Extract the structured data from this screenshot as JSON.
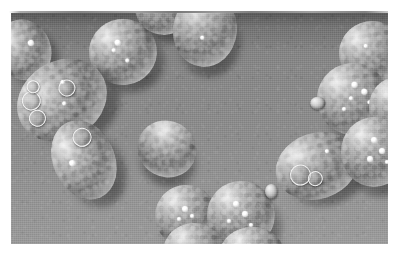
{
  "figure": {
    "kind": "scanning-electron-micrograph",
    "color_mode": "grayscale",
    "border_style": "white margin with thin dark rule along top edge",
    "plate": {
      "left": 11,
      "top": 13,
      "width": 377,
      "height": 231
    },
    "caption": "",
    "scale_bar": "",
    "magnification_label": ""
  },
  "colors": {
    "page_background": "#ffffff",
    "substrate_gray": "#8a8a8a",
    "substrate_top_shade": "#6f6f6f",
    "substrate_bottom_shade": "#9a9a9a",
    "cell_highlight": "#e9e9e9",
    "cell_midtone": "#a6a6a6",
    "cell_shadow": "#4a4a4a",
    "granule_white": "#ffffff",
    "top_rule": "#6f6f6f"
  },
  "micrograph": {
    "cell_count": 16,
    "description": "Ovoid and spherical yeast cells scattered on a smooth gray substrate, lit from the upper left, each casting a soft shadow to the lower right. Several cells show raised circular bud scars and bright surface granules.",
    "cells": [
      {
        "id": "cell-top-left-edge",
        "shape": "ovoid",
        "x": -14,
        "y": 6,
        "w": 54,
        "h": 62,
        "rot": -22,
        "clipped": "left edge",
        "granules": [
          [
            62,
            38,
            3
          ]
        ],
        "scars": [],
        "buds": []
      },
      {
        "id": "cell-top-center-1",
        "shape": "spherical",
        "x": 78,
        "y": 6,
        "w": 68,
        "h": 66,
        "rot": -8,
        "clipped": "",
        "granules": [
          [
            40,
            30,
            3
          ],
          [
            34,
            42,
            2
          ],
          [
            52,
            60,
            2
          ]
        ],
        "scars": [],
        "buds": []
      },
      {
        "id": "cell-top-center-2",
        "shape": "spherical",
        "x": 124,
        "y": -34,
        "w": 58,
        "h": 56,
        "rot": 0,
        "clipped": "top edge",
        "granules": [],
        "scars": [],
        "buds": []
      },
      {
        "id": "cell-top-center-3",
        "shape": "ovoid",
        "x": 162,
        "y": -20,
        "w": 64,
        "h": 74,
        "rot": 6,
        "clipped": "top edge",
        "granules": [
          [
            44,
            58,
            2
          ]
        ],
        "scars": [],
        "buds": []
      },
      {
        "id": "cell-upper-left-scarred",
        "shape": "ovoid",
        "x": 4,
        "y": 48,
        "w": 94,
        "h": 78,
        "rot": -32,
        "clipped": "",
        "granules": [
          [
            58,
            28,
            2
          ],
          [
            48,
            52,
            2
          ]
        ],
        "scars": [
          [
            12,
            18,
            17
          ],
          [
            8,
            42,
            15
          ],
          [
            52,
            30,
            15
          ],
          [
            24,
            8,
            11
          ]
        ],
        "buds": []
      },
      {
        "id": "cell-left-mid",
        "shape": "ovoid",
        "x": 42,
        "y": 106,
        "w": 62,
        "h": 82,
        "rot": -24,
        "clipped": "",
        "granules": [
          [
            26,
            44,
            3
          ]
        ],
        "scars": [
          [
            46,
            12,
            17
          ]
        ],
        "buds": []
      },
      {
        "id": "cell-center-isolated",
        "shape": "ovoid",
        "x": 126,
        "y": 108,
        "w": 60,
        "h": 56,
        "rot": 28,
        "clipped": "",
        "granules": [],
        "scars": [],
        "buds": []
      },
      {
        "id": "cell-bottom-left",
        "shape": "spherical",
        "x": 144,
        "y": 172,
        "w": 62,
        "h": 62,
        "rot": 0,
        "clipped": "",
        "granules": [
          [
            44,
            34,
            3
          ],
          [
            56,
            46,
            2
          ],
          [
            36,
            52,
            2
          ]
        ],
        "scars": [],
        "buds": []
      },
      {
        "id": "cell-bottom-center",
        "shape": "spherical",
        "x": 196,
        "y": 168,
        "w": 68,
        "h": 68,
        "rot": 0,
        "clipped": "",
        "granules": [
          [
            38,
            30,
            3
          ],
          [
            52,
            44,
            3
          ],
          [
            30,
            56,
            2
          ],
          [
            62,
            62,
            2
          ]
        ],
        "scars": [],
        "buds": [
          [
            86,
            4,
            13,
            15
          ]
        ]
      },
      {
        "id": "cell-bottom-lower-1",
        "shape": "spherical",
        "x": 152,
        "y": 210,
        "w": 62,
        "h": 58,
        "rot": 0,
        "clipped": "bottom edge",
        "granules": [],
        "scars": [],
        "buds": []
      },
      {
        "id": "cell-bottom-lower-2",
        "shape": "spherical",
        "x": 208,
        "y": 214,
        "w": 66,
        "h": 58,
        "rot": 0,
        "clipped": "bottom edge",
        "granules": [],
        "scars": [],
        "buds": []
      },
      {
        "id": "cell-right-upper",
        "shape": "spherical",
        "x": 328,
        "y": 8,
        "w": 66,
        "h": 64,
        "rot": -10,
        "clipped": "right edge",
        "granules": [
          [
            40,
            34,
            2
          ]
        ],
        "scars": [],
        "buds": []
      },
      {
        "id": "cell-right-granular",
        "shape": "spherical",
        "x": 306,
        "y": 50,
        "w": 72,
        "h": 72,
        "rot": -6,
        "clipped": "right edge",
        "granules": [
          [
            50,
            26,
            3
          ],
          [
            62,
            38,
            3
          ],
          [
            44,
            46,
            2
          ],
          [
            70,
            54,
            2
          ],
          [
            34,
            60,
            2
          ]
        ],
        "scars": [],
        "buds": [
          [
            -10,
            42,
            15,
            13
          ]
        ]
      },
      {
        "id": "cell-right-far",
        "shape": "spherical",
        "x": 358,
        "y": 64,
        "w": 56,
        "h": 60,
        "rot": 0,
        "clipped": "right edge",
        "granules": [],
        "scars": [],
        "buds": []
      },
      {
        "id": "cell-right-mid-ovoid",
        "shape": "ovoid",
        "x": 264,
        "y": 120,
        "w": 84,
        "h": 66,
        "rot": -18,
        "clipped": "",
        "granules": [
          [
            64,
            30,
            2
          ]
        ],
        "scars": [
          [
            16,
            40,
            19
          ],
          [
            34,
            56,
            13
          ]
        ],
        "buds": []
      },
      {
        "id": "cell-right-mid-round",
        "shape": "spherical",
        "x": 330,
        "y": 104,
        "w": 66,
        "h": 70,
        "rot": 0,
        "clipped": "right edge",
        "granules": [
          [
            46,
            28,
            3
          ],
          [
            58,
            44,
            3
          ],
          [
            40,
            56,
            3
          ],
          [
            66,
            62,
            2
          ]
        ],
        "scars": [],
        "buds": []
      }
    ]
  }
}
